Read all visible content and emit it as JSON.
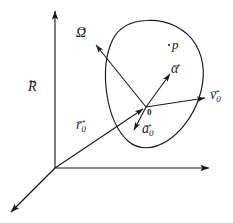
{
  "figure": {
    "background_color": "#ffffff",
    "stroke_color": "#1a1a1a",
    "width": 233,
    "height": 223
  },
  "frame": {
    "label": "R",
    "accent": "tilde",
    "origin_label": "0",
    "axes": [
      {
        "name": "vertical-axis",
        "from": [
          55,
          168
        ],
        "to": [
          55,
          9
        ]
      },
      {
        "name": "horizontal-axis",
        "from": [
          55,
          168
        ],
        "to": [
          212,
          168
        ]
      },
      {
        "name": "depth-axis",
        "from": [
          55,
          168
        ],
        "to": [
          9,
          214
        ]
      }
    ]
  },
  "body": {
    "name": "rigid-body-outline",
    "point_label": "p",
    "body_origin_label": "0"
  },
  "vectors": [
    {
      "id": "omega",
      "symbol": "Ω",
      "subscript": "",
      "accent": "arrow",
      "label": "Ω",
      "from": [
        146,
        107
      ],
      "to": [
        93,
        42
      ]
    },
    {
      "id": "alpha",
      "symbol": "α",
      "subscript": "",
      "accent": "arrow",
      "label": "α",
      "from": [
        146,
        107
      ],
      "to": [
        172,
        71
      ]
    },
    {
      "id": "v0",
      "symbol": "v",
      "subscript": "0",
      "accent": "arrow",
      "label": "v0",
      "from": [
        146,
        107
      ],
      "to": [
        208,
        97
      ]
    },
    {
      "id": "a0",
      "symbol": "a",
      "subscript": "0",
      "accent": "arrow",
      "label": "a0",
      "from": [
        146,
        107
      ],
      "to": [
        132,
        133
      ]
    },
    {
      "id": "r0",
      "symbol": "r",
      "subscript": "0",
      "accent": "arrow",
      "label": "r0",
      "from": [
        55,
        168
      ],
      "to": [
        146,
        107
      ]
    }
  ],
  "labels": {
    "omega": "Ω",
    "alpha": "α",
    "v": "v",
    "a": "a",
    "r": "r",
    "R": "R",
    "p": "p",
    "zero": "0",
    "sub_zero": "0"
  }
}
